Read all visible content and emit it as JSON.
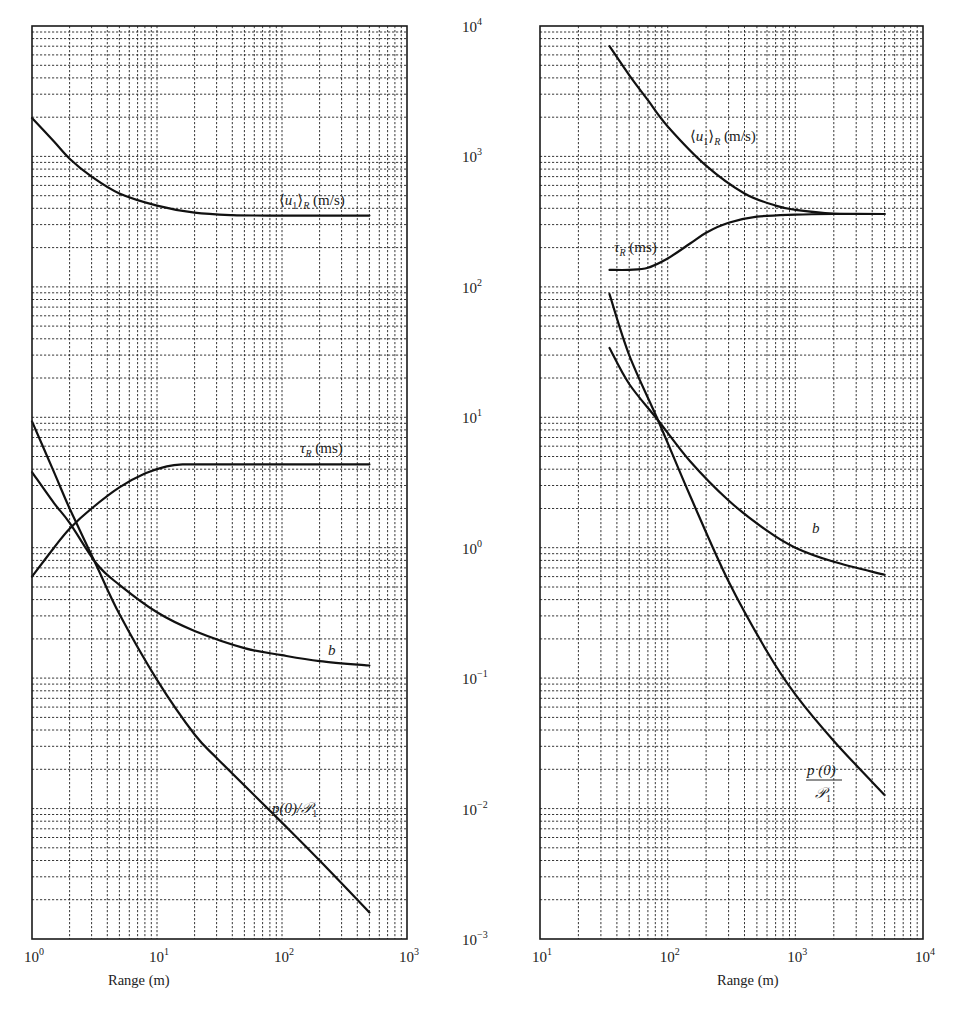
{
  "figure": {
    "shared_y_axis_ticks": [
      "10^4",
      "10^3",
      "10^2",
      "10^1",
      "10^0",
      "10^-1",
      "10^-2",
      "10^-3"
    ]
  },
  "chart_data": [
    {
      "type": "line",
      "panel": "left",
      "xscale": "log",
      "yscale": "log",
      "xlabel": "Range (m)",
      "ylabel": "",
      "xlim": [
        1,
        1000
      ],
      "ylim": [
        0.001,
        10000
      ],
      "x_ticks": [
        "10^0",
        "10^1",
        "10^2",
        "10^3"
      ],
      "y_ticks": [
        "10^-3",
        "10^-2",
        "10^-1",
        "10^0",
        "10^1",
        "10^2",
        "10^3",
        "10^4"
      ],
      "grid": true,
      "grid_style": "dashed major+minor",
      "series": [
        {
          "name": "⟨u1⟩R (m/s)",
          "label_parts": {
            "pre": "⟨",
            "var": "u",
            "sub1": "1",
            "post": "⟩",
            "sub2": "R",
            "unit": " (m/s)"
          },
          "points": [
            [
              1,
              1970
            ],
            [
              1.5,
              1300
            ],
            [
              2,
              960
            ],
            [
              3,
              700
            ],
            [
              5,
              520
            ],
            [
              10,
              420
            ],
            [
              20,
              370
            ],
            [
              40,
              355
            ],
            [
              100,
              352
            ],
            [
              500,
              352
            ]
          ]
        },
        {
          "name": "τR (ms)",
          "label_parts": {
            "var": "τ",
            "sub": "R",
            "unit": " (ms)"
          },
          "points": [
            [
              1,
              0.6
            ],
            [
              1.5,
              1.0
            ],
            [
              2,
              1.4
            ],
            [
              3,
              2.0
            ],
            [
              5,
              2.9
            ],
            [
              8,
              3.7
            ],
            [
              12,
              4.2
            ],
            [
              16,
              4.35
            ],
            [
              30,
              4.35
            ],
            [
              100,
              4.35
            ],
            [
              500,
              4.35
            ]
          ]
        },
        {
          "name": "b",
          "label_parts": {
            "var": "b"
          },
          "points": [
            [
              1,
              3.8
            ],
            [
              1.5,
              2.2
            ],
            [
              2,
              1.55
            ],
            [
              3.3,
              0.75
            ],
            [
              5,
              0.52
            ],
            [
              10,
              0.32
            ],
            [
              20,
              0.23
            ],
            [
              50,
              0.17
            ],
            [
              100,
              0.15
            ],
            [
              200,
              0.135
            ],
            [
              500,
              0.125
            ]
          ]
        },
        {
          "name": "p(0)/P1",
          "label_parts": {
            "text": "p(0)/𝒫",
            "sub": "1"
          },
          "points": [
            [
              1,
              9.3
            ],
            [
              1.5,
              3.8
            ],
            [
              2,
              2.0
            ],
            [
              3.3,
              0.72
            ],
            [
              5,
              0.31
            ],
            [
              10,
              0.097
            ],
            [
              20,
              0.037
            ],
            [
              32,
              0.023
            ],
            [
              100,
              0.0078
            ],
            [
              200,
              0.004
            ],
            [
              500,
              0.0016
            ]
          ]
        }
      ]
    },
    {
      "type": "line",
      "panel": "right",
      "xscale": "log",
      "yscale": "log",
      "xlabel": "Range (m)",
      "ylabel": "",
      "xlim": [
        10,
        10000
      ],
      "ylim": [
        0.001,
        10000
      ],
      "x_ticks": [
        "10^1",
        "10^2",
        "10^3",
        "10^4"
      ],
      "y_ticks": [
        "10^-3",
        "10^-2",
        "10^-1",
        "10^0",
        "10^1",
        "10^2",
        "10^3",
        "10^4"
      ],
      "grid": true,
      "grid_style": "dashed major+minor",
      "series": [
        {
          "name": "⟨u1⟩R (m/s)",
          "label_parts": {
            "pre": "⟨",
            "var": "u",
            "sub1": "1",
            "post": "⟩",
            "sub2": "R",
            "unit": " (m/s)"
          },
          "points": [
            [
              35,
              7000
            ],
            [
              50,
              4200
            ],
            [
              70,
              2700
            ],
            [
              100,
              1700
            ],
            [
              200,
              850
            ],
            [
              400,
              520
            ],
            [
              700,
              420
            ],
            [
              1000,
              390
            ],
            [
              2000,
              365
            ],
            [
              5000,
              362
            ]
          ]
        },
        {
          "name": "τR (ms)",
          "label_parts": {
            "var": "τ",
            "sub": "R",
            "unit": " (ms)"
          },
          "points": [
            [
              35,
              135
            ],
            [
              50,
              135
            ],
            [
              70,
              140
            ],
            [
              100,
              165
            ],
            [
              150,
              215
            ],
            [
              200,
              260
            ],
            [
              300,
              310
            ],
            [
              500,
              345
            ],
            [
              1000,
              358
            ],
            [
              2000,
              362
            ],
            [
              5000,
              362
            ]
          ]
        },
        {
          "name": "b",
          "label_parts": {
            "var": "b"
          },
          "points": [
            [
              35,
              34
            ],
            [
              50,
              18
            ],
            [
              84,
              9.5
            ],
            [
              150,
              4.6
            ],
            [
              300,
              2.3
            ],
            [
              600,
              1.35
            ],
            [
              1000,
              1.0
            ],
            [
              2000,
              0.78
            ],
            [
              5000,
              0.62
            ]
          ]
        },
        {
          "name": "p(0)/P1",
          "label_parts": {
            "num": "p (0)",
            "den": "𝒫",
            "den_sub": "1"
          },
          "points": [
            [
              35,
              88
            ],
            [
              50,
              30
            ],
            [
              84,
              9.5
            ],
            [
              150,
              2.5
            ],
            [
              300,
              0.55
            ],
            [
              600,
              0.16
            ],
            [
              1000,
              0.075
            ],
            [
              2000,
              0.033
            ],
            [
              5000,
              0.0127
            ]
          ]
        }
      ]
    }
  ]
}
